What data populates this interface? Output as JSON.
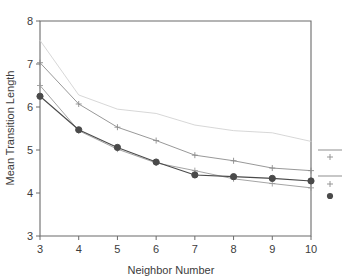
{
  "chart_data": {
    "type": "line",
    "title": "",
    "xlabel": "Neighbor Number",
    "ylabel": "Mean Transition Length",
    "x": [
      3,
      4,
      5,
      6,
      7,
      8,
      9,
      10
    ],
    "xlim": [
      3,
      10
    ],
    "ylim": [
      3,
      8
    ],
    "xticks": [
      "3",
      "4",
      "5",
      "6",
      "7",
      "8",
      "9",
      "10"
    ],
    "yticks": [
      "3",
      "4",
      "5",
      "6",
      "7",
      "8"
    ],
    "grid": false,
    "legend_position": "right-outside",
    "series": [
      {
        "name": "series-1-light",
        "marker": "none",
        "color": "#d2d2d2",
        "values": [
          7.55,
          6.28,
          5.95,
          5.85,
          5.58,
          5.45,
          5.4,
          5.2
        ]
      },
      {
        "name": "series-2-plus-upper",
        "marker": "plus",
        "color": "#8c8c8c",
        "values": [
          7.03,
          6.07,
          5.53,
          5.22,
          4.88,
          4.75,
          4.58,
          4.52
        ]
      },
      {
        "name": "series-3-plus-lower",
        "marker": "plus",
        "color": "#9a9a9a",
        "values": [
          6.5,
          5.45,
          5.02,
          4.7,
          4.52,
          4.33,
          4.22,
          4.12
        ]
      },
      {
        "name": "series-4-circle",
        "marker": "circle",
        "color": "#4a4a4a",
        "values": [
          6.25,
          5.47,
          5.06,
          4.72,
          4.42,
          4.38,
          4.34,
          4.28
        ]
      }
    ],
    "legend_entries": [
      {
        "marker": "line",
        "label": ""
      },
      {
        "marker": "plus",
        "label": ""
      },
      {
        "marker": "line",
        "label": ""
      },
      {
        "marker": "plus",
        "label": ""
      },
      {
        "marker": "circle",
        "label": ""
      }
    ]
  },
  "colors": {
    "axis": "#6b6b6b",
    "text": "#3c3c3c",
    "background": "#ffffff"
  }
}
